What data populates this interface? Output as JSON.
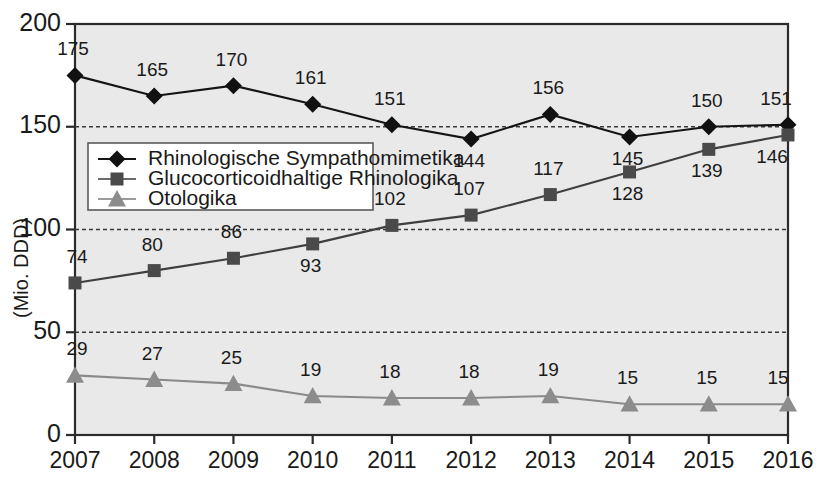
{
  "chart_data": {
    "type": "line",
    "title": "",
    "xlabel": "",
    "ylabel": "(Mio. DDD)",
    "categories": [
      "2007",
      "2008",
      "2009",
      "2010",
      "2011",
      "2012",
      "2013",
      "2014",
      "2015",
      "2016"
    ],
    "ylim": [
      0,
      200
    ],
    "yticks": [
      0,
      50,
      100,
      150,
      200
    ],
    "grid": "horizontal-dashed",
    "legend_position": "inside-upper-left",
    "series": [
      {
        "name": "Rhinologische Sympathomimetika",
        "marker": "diamond",
        "color": "#111111",
        "values": [
          175,
          165,
          170,
          161,
          151,
          144,
          156,
          145,
          150,
          151
        ],
        "labels": [
          "175",
          "165",
          "170",
          "161",
          "151",
          "144",
          "156",
          "145",
          "150",
          "151"
        ]
      },
      {
        "name": "Glucocorticoidhaltige Rhinologika",
        "marker": "square",
        "color": "#4a4a4a",
        "values": [
          74,
          80,
          86,
          93,
          102,
          107,
          117,
          128,
          139,
          146
        ],
        "labels": [
          "74",
          "80",
          "86",
          "93",
          "102",
          "107",
          "117",
          "128",
          "139",
          "146"
        ]
      },
      {
        "name": "Otologika",
        "marker": "triangle",
        "color": "#8c8c8c",
        "values": [
          29,
          27,
          25,
          19,
          18,
          18,
          19,
          15,
          15,
          15
        ],
        "labels": [
          "29",
          "27",
          "25",
          "19",
          "18",
          "18",
          "19",
          "15",
          "15",
          "15"
        ]
      }
    ]
  },
  "axes": {
    "y_tick_labels": [
      "200",
      "150",
      "100",
      "50",
      "0"
    ],
    "y_axis_title": "(Mio. DDD)",
    "x_tick_labels": [
      "2007",
      "2008",
      "2009",
      "2010",
      "2011",
      "2012",
      "2013",
      "2014",
      "2015",
      "2016"
    ]
  },
  "legend": {
    "entries": [
      {
        "label": "Rhinologische Sympathomimetika",
        "marker": "diamond-marker-icon"
      },
      {
        "label": "Glucocorticoidhaltige Rhinologika",
        "marker": "square-marker-icon"
      },
      {
        "label": "Otologika",
        "marker": "triangle-marker-icon"
      }
    ]
  },
  "colors": {
    "plot_background": "#e9e9e9",
    "axis": "#2b2b2b",
    "series_a": "#111111",
    "series_b": "#4a4a4a",
    "series_c": "#8c8c8c",
    "page_background": "#ffffff"
  },
  "label_offsets": {
    "series_a": [
      {
        "dx": -2,
        "dy": -20
      },
      {
        "dx": -2,
        "dy": -20
      },
      {
        "dx": -2,
        "dy": -20
      },
      {
        "dx": -2,
        "dy": -20
      },
      {
        "dx": -2,
        "dy": -20
      },
      {
        "dx": -2,
        "dy": 28
      },
      {
        "dx": -2,
        "dy": -20
      },
      {
        "dx": -2,
        "dy": 28
      },
      {
        "dx": -2,
        "dy": -20
      },
      {
        "dx": -12,
        "dy": -20
      }
    ],
    "series_b": [
      {
        "dx": 2,
        "dy": -20
      },
      {
        "dx": -2,
        "dy": -20
      },
      {
        "dx": -2,
        "dy": -20
      },
      {
        "dx": -2,
        "dy": 28
      },
      {
        "dx": -2,
        "dy": -20
      },
      {
        "dx": -2,
        "dy": -20
      },
      {
        "dx": -2,
        "dy": -20
      },
      {
        "dx": -2,
        "dy": 28
      },
      {
        "dx": -2,
        "dy": 28
      },
      {
        "dx": -16,
        "dy": 28
      }
    ],
    "series_c": [
      {
        "dx": 2,
        "dy": -20
      },
      {
        "dx": -2,
        "dy": -20
      },
      {
        "dx": -2,
        "dy": -20
      },
      {
        "dx": -2,
        "dy": -20
      },
      {
        "dx": -2,
        "dy": -20
      },
      {
        "dx": -2,
        "dy": -20
      },
      {
        "dx": -2,
        "dy": -20
      },
      {
        "dx": -2,
        "dy": -20
      },
      {
        "dx": -2,
        "dy": -20
      },
      {
        "dx": -10,
        "dy": -20
      }
    ]
  }
}
